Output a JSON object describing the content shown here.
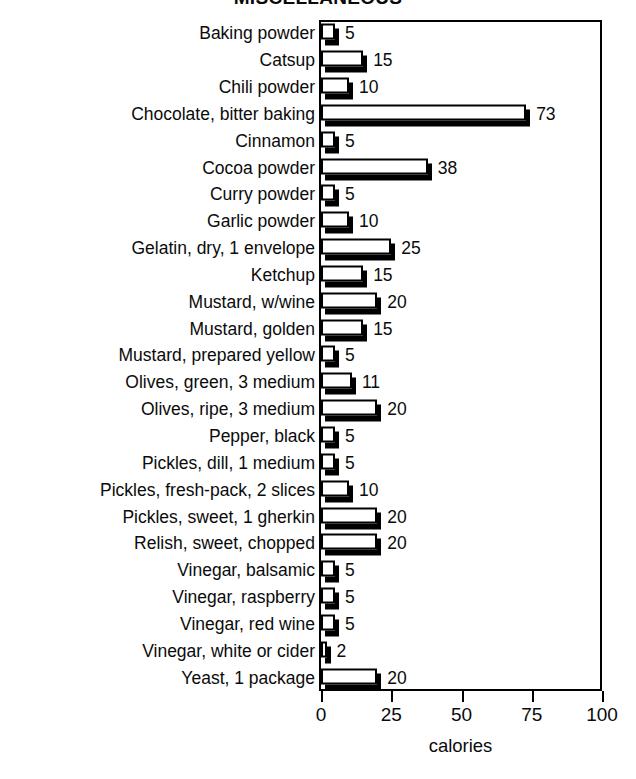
{
  "chart_data": {
    "type": "bar",
    "orientation": "horizontal",
    "title": "MISCELLANEOUS",
    "xlabel": "calories",
    "ylabel": "",
    "xlim": [
      0,
      100
    ],
    "xticks": [
      0,
      25,
      50,
      75,
      100
    ],
    "grid": false,
    "legend": null,
    "value_labels": true,
    "categories": [
      "Baking powder",
      "Catsup",
      "Chili powder",
      "Chocolate, bitter baking",
      "Cinnamon",
      "Cocoa powder",
      "Curry powder",
      "Garlic powder",
      "Gelatin, dry, 1 envelope",
      "Ketchup",
      "Mustard, w/wine",
      "Mustard, golden",
      "Mustard, prepared yellow",
      "Olives, green, 3 medium",
      "Olives, ripe, 3 medium",
      "Pepper, black",
      "Pickles, dill, 1 medium",
      "Pickles, fresh-pack, 2 slices",
      "Pickles, sweet, 1 gherkin",
      "Relish, sweet, chopped",
      "Vinegar, balsamic",
      "Vinegar, raspberry",
      "Vinegar, red wine",
      "Vinegar, white or cider",
      "Yeast, 1 package"
    ],
    "values": [
      5,
      15,
      10,
      73,
      5,
      38,
      5,
      10,
      25,
      15,
      20,
      15,
      5,
      11,
      20,
      5,
      5,
      10,
      20,
      20,
      5,
      5,
      5,
      2,
      20
    ]
  },
  "axis": {
    "tick_labels": [
      "0",
      "25",
      "50",
      "75",
      "100"
    ],
    "title": "calories"
  },
  "colors": {
    "bar_face": "#ffffff",
    "bar_shadow": "#000000",
    "outline": "#000000",
    "text": "#0b0b0b",
    "background": "#ffffff"
  }
}
